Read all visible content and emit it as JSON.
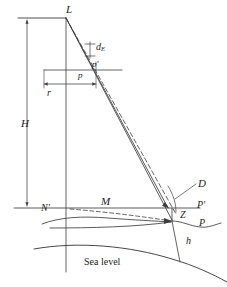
{
  "diagram": {
    "type": "technical-line-diagram",
    "caption_text": "Sea level",
    "labels": {
      "lens_point": "L",
      "earth_curvature_displacement": "d",
      "earth_curvature_displacement_sub": "E",
      "image_point_displaced": "p′",
      "image_point": "p",
      "radial_distance": "r",
      "flying_height": "H",
      "nadir_ground": "N′",
      "ground_distance": "M",
      "slant_distance": "D",
      "ground_point_datum": "P′",
      "curvature_correction": "Z",
      "ground_point": "P",
      "terrain_elevation": "h",
      "sea_level": "Sea level"
    },
    "colors": {
      "line": "#3d3d3d",
      "text": "#1c1c1c",
      "background": "#ffffff"
    },
    "geometry": {
      "camera_station": [
        66,
        18
      ],
      "nadir_on_axis": [
        66,
        208
      ],
      "ground_point": [
        172,
        221
      ],
      "datum_point": [
        172,
        208
      ],
      "focal_plane_y": 70,
      "image_point_x": 94
    },
    "elements": {
      "solid_rays": 2,
      "dashed_rays": 1,
      "vertical_axis": true,
      "sea_level_arc": true,
      "terrain_profile": true
    }
  }
}
